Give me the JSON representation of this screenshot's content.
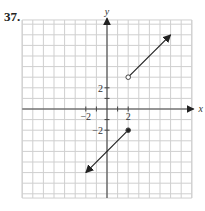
{
  "problem_number": "37.",
  "chart_data": {
    "type": "line",
    "title": "",
    "xlabel": "x",
    "ylabel": "y",
    "xlim": [
      -8,
      8
    ],
    "ylim": [
      -8.4,
      8.4
    ],
    "grid": true,
    "x_ticks_labeled": [
      -2,
      2
    ],
    "y_ticks_labeled": [
      2,
      -2
    ],
    "tick_labels": {
      "x": [
        "−2",
        "2"
      ],
      "y": [
        "2",
        "−2"
      ]
    },
    "series": [
      {
        "name": "upper ray",
        "start": {
          "x": 2,
          "y": 3,
          "endpoint": "open"
        },
        "end": {
          "x": 6,
          "y": 7,
          "arrow": true
        },
        "slope": 1
      },
      {
        "name": "lower ray",
        "start": {
          "x": 2,
          "y": -2,
          "endpoint": "closed"
        },
        "end": {
          "x": -2,
          "y": -6,
          "arrow": true
        },
        "slope": 1
      }
    ]
  }
}
